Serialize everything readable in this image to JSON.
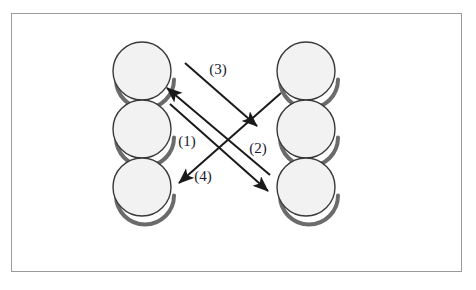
{
  "figure": {
    "title": "",
    "background_color": "#ffffff",
    "border_color": "#9a9a9a",
    "border": {
      "x": 11,
      "y": 13,
      "width": 451,
      "height": 259
    }
  },
  "nodes": {
    "radius": 29,
    "fill_color": "#f2f2f2",
    "stroke_color": "#3a3a3a",
    "shadow_color": "#6b6b6b",
    "left_column": [
      {
        "id": "left-node-1",
        "cx": 142,
        "cy": 71,
        "label": ""
      },
      {
        "id": "left-node-2",
        "cx": 142,
        "cy": 129,
        "label": ""
      },
      {
        "id": "left-node-3",
        "cx": 142,
        "cy": 187,
        "label": ""
      }
    ],
    "right_column": [
      {
        "id": "right-node-1",
        "cx": 306,
        "cy": 71,
        "label": ""
      },
      {
        "id": "right-node-2",
        "cx": 306,
        "cy": 129,
        "label": ""
      },
      {
        "id": "right-node-3",
        "cx": 306,
        "cy": 187,
        "label": ""
      }
    ]
  },
  "arrows": {
    "color": "#1a1a1a",
    "stroke_width": 2,
    "items": [
      {
        "id": "arrow-3",
        "label": "(3)",
        "from": "left-node-1-upper-right",
        "to": "right-node-2-upper-left",
        "x1": 185,
        "y1": 63,
        "x2": 257,
        "y2": 126,
        "label_x": 218,
        "label_y": 74,
        "direction": "left-to-right-down"
      },
      {
        "id": "arrow-1",
        "label": "(1)",
        "from": "right-node-3-left",
        "to": "left-node-1-lower-right",
        "x1": 270,
        "y1": 175,
        "x2": 167,
        "y2": 88,
        "label_x": 187,
        "label_y": 146,
        "direction": "right-to-left-up"
      },
      {
        "id": "arrow-2",
        "label": "(2)",
        "from": "left-node-2-right",
        "to": "right-node-3-upper-left",
        "x1": 170,
        "y1": 104,
        "x2": 268,
        "y2": 191,
        "label_x": 258,
        "label_y": 153,
        "direction": "left-to-right-down"
      },
      {
        "id": "arrow-4",
        "label": "(4)",
        "from": "right-node-1-lower-left",
        "to": "left-node-3-upper-right",
        "x1": 281,
        "y1": 93,
        "x2": 179,
        "y2": 183,
        "label_x": 203,
        "label_y": 181,
        "direction": "right-to-left-down"
      }
    ]
  }
}
